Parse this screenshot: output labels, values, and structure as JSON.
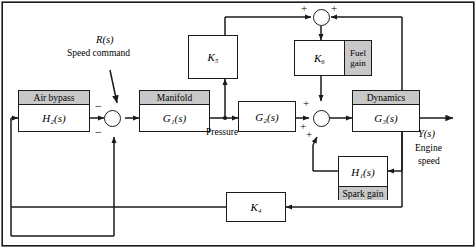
{
  "figure": {
    "type": "control-system-block-diagram",
    "border": true,
    "colors": {
      "line": "#1a1a1a",
      "block_fill": "#ffffff",
      "header_fill": "#c8c8c8",
      "background": "#ffffff"
    }
  },
  "inputs": [
    {
      "symbol": "R(s)",
      "label": "Speed command"
    }
  ],
  "outputs": [
    {
      "symbol": "Y(s)",
      "label": "Engine speed"
    }
  ],
  "blocks": [
    {
      "id": "air_bypass",
      "header": "Air bypass",
      "transfer": "H₂(s)",
      "footer": ""
    },
    {
      "id": "manifold",
      "header": "Manifold",
      "transfer": "G₁(s)",
      "footer": ""
    },
    {
      "id": "g2",
      "header": "",
      "transfer": "G₂(s)",
      "footer": ""
    },
    {
      "id": "dynamics",
      "header": "Dynamics",
      "transfer": "G₃(s)",
      "footer": ""
    },
    {
      "id": "k5",
      "header": "",
      "transfer": "K₅",
      "footer": ""
    },
    {
      "id": "k6",
      "header": "",
      "transfer": "K₆",
      "footer": "",
      "side_tag": "Fuel gain"
    },
    {
      "id": "k4",
      "header": "",
      "transfer": "K₄",
      "footer": ""
    },
    {
      "id": "h1",
      "header": "",
      "transfer": "H₁(s)",
      "footer": "Spark gain"
    }
  ],
  "signal_labels": [
    {
      "id": "pressure",
      "text": "Pressure"
    }
  ],
  "summing_junctions": [
    {
      "id": "sum_top",
      "signs": [
        "+",
        "+"
      ]
    },
    {
      "id": "sum_input",
      "signs": [
        "−",
        "−"
      ]
    },
    {
      "id": "sum_main",
      "signs": [
        "+",
        "+",
        "+"
      ]
    }
  ]
}
